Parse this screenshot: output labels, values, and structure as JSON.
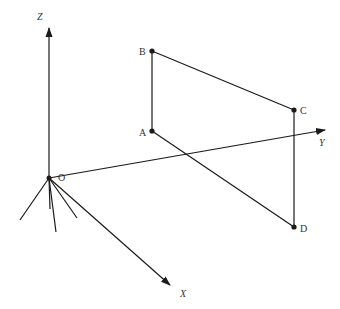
{
  "diagram": {
    "colors": {
      "stroke": "#1a1a1a",
      "label": "#333333",
      "background": "#ffffff"
    },
    "origin": {
      "label": "O",
      "x": 49,
      "y": 178
    },
    "axes": [
      {
        "name": "z-axis",
        "label": "Z",
        "tip": [
          49,
          28
        ],
        "label_pos": [
          37,
          20
        ]
      },
      {
        "name": "y-axis",
        "label": "Y",
        "tip": [
          325,
          130
        ],
        "label_pos": [
          319,
          146
        ]
      },
      {
        "name": "x-axis",
        "label": "X",
        "tip": [
          170,
          285
        ],
        "label_pos": [
          180,
          297
        ]
      }
    ],
    "points": [
      {
        "label": "A",
        "x": 152,
        "y": 131,
        "label_pos": [
          139,
          136
        ]
      },
      {
        "label": "B",
        "x": 152,
        "y": 51,
        "label_pos": [
          139,
          55
        ]
      },
      {
        "label": "C",
        "x": 294,
        "y": 110,
        "label_pos": [
          300,
          114
        ]
      },
      {
        "label": "D",
        "x": 294,
        "y": 227,
        "label_pos": [
          300,
          232
        ]
      }
    ],
    "segments": [
      [
        "B",
        "A"
      ],
      [
        "B",
        "C"
      ],
      [
        "C",
        "D"
      ],
      [
        "A",
        "D"
      ]
    ],
    "hatch_lines": [
      [
        20,
        220
      ],
      [
        50,
        209
      ],
      [
        56,
        232
      ],
      [
        77,
        218
      ]
    ]
  }
}
